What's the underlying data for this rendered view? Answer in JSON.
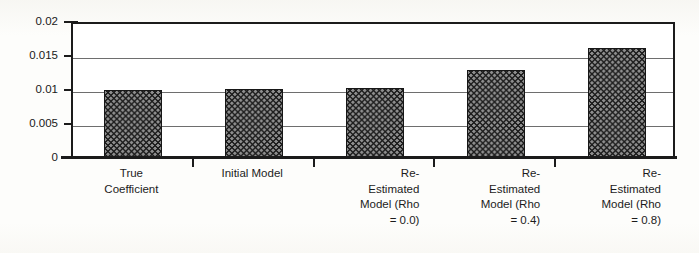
{
  "chart_data": {
    "type": "bar",
    "title": "",
    "subtitle": "",
    "xlabel": "",
    "ylabel": "",
    "categories": [
      "True\nCoefficient",
      "Initial Model",
      "Re-\nEstimated\nModel (Rho\n= 0.0)",
      "Re-\nEstimated\nModel (Rho\n= 0.4)",
      "Re-\nEstimated\nModel (Rho\n= 0.8)"
    ],
    "values": [
      0.01,
      0.0101,
      0.0103,
      0.013,
      0.0162
    ],
    "ylim": [
      0,
      0.02
    ],
    "ytick_values": [
      0,
      0.005,
      0.01,
      0.015,
      0.02
    ],
    "ytick_labels": [
      "0",
      "0.005",
      "0.01",
      "0.015",
      "0.02"
    ],
    "grid": true,
    "legend": false,
    "legend_position": "none",
    "series": [
      {
        "name": "Coefficient value",
        "values": [
          0.01,
          0.0101,
          0.0103,
          0.013,
          0.0162
        ]
      }
    ],
    "bar_fill": "dark-crosshatch-pattern",
    "colors": {
      "bar_fill": "#8e8e8e",
      "bar_pattern": "#1c1c1c",
      "bar_border": "#171717",
      "axis": "#1b1b1b",
      "gridline": "#6e6e6e",
      "text": "#1c1c1c",
      "background": "#fdfdfb",
      "plot_background": "#ffffff"
    }
  },
  "axis": {
    "y_ticks": [
      {
        "label": "0.02",
        "value": 0.02
      },
      {
        "label": "0.015",
        "value": 0.015
      },
      {
        "label": "0.01",
        "value": 0.01
      },
      {
        "label": "0.005",
        "value": 0.005
      },
      {
        "label": "0",
        "value": 0
      }
    ]
  },
  "categories": [
    {
      "label": "True\nCoefficient",
      "align": "center"
    },
    {
      "label": "Initial Model",
      "align": "center"
    },
    {
      "label": "Re-\nEstimated\nModel (Rho\n= 0.0)",
      "align": "right"
    },
    {
      "label": "Re-\nEstimated\nModel (Rho\n= 0.4)",
      "align": "right"
    },
    {
      "label": "Re-\nEstimated\nModel (Rho\n= 0.8)",
      "align": "right"
    }
  ]
}
